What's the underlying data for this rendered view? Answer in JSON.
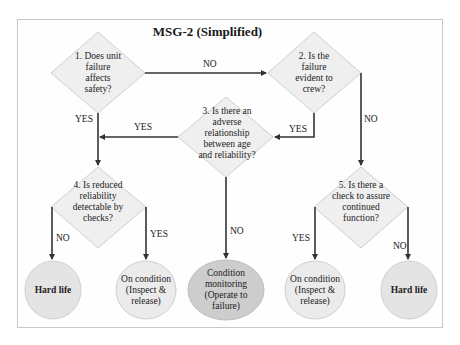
{
  "title": "MSG-2 (Simplified)",
  "colors": {
    "diamond_fill": "#efefef",
    "diamond_stroke": "#cfcfcf",
    "circle_fill": "#e4e4e4",
    "circle_dark_fill": "#cdcdcd",
    "arrow": "#333333",
    "frame": "#c8c8c8"
  },
  "decisions": [
    {
      "id": "q1",
      "text": "1. Does unit failure affects safety?"
    },
    {
      "id": "q2",
      "text": "2. Is the failure evident to crew?"
    },
    {
      "id": "q3",
      "text": "3. Is there an adverse relationship between age and reliability?"
    },
    {
      "id": "q4",
      "text": "4. Is reduced reliability detectable by checks?"
    },
    {
      "id": "q5",
      "text": "5. Is there a check to assure continued function?"
    }
  ],
  "outcomes": [
    {
      "id": "o1",
      "text": "Hard life"
    },
    {
      "id": "o2",
      "text": "On condition (Inspect & release)"
    },
    {
      "id": "o3",
      "text": "Condition monitoring (Operate to failure)"
    },
    {
      "id": "o4",
      "text": "On condition (Inspect & release)"
    },
    {
      "id": "o5",
      "text": "Hard life"
    }
  ],
  "edges": [
    {
      "from": "q1",
      "to": "q2",
      "label": "NO"
    },
    {
      "from": "q1",
      "to": "q4",
      "label": "YES"
    },
    {
      "from": "q2",
      "to": "q3",
      "label": "YES"
    },
    {
      "from": "q2",
      "to": "q5",
      "label": "NO"
    },
    {
      "from": "q3",
      "to": "q4",
      "label": "YES"
    },
    {
      "from": "q3",
      "to": "o3",
      "label": "NO"
    },
    {
      "from": "q4",
      "to": "o1",
      "label": "NO"
    },
    {
      "from": "q4",
      "to": "o2",
      "label": "YES"
    },
    {
      "from": "q5",
      "to": "o4",
      "label": "YES"
    },
    {
      "from": "q5",
      "to": "o5",
      "label": "NO"
    }
  ]
}
